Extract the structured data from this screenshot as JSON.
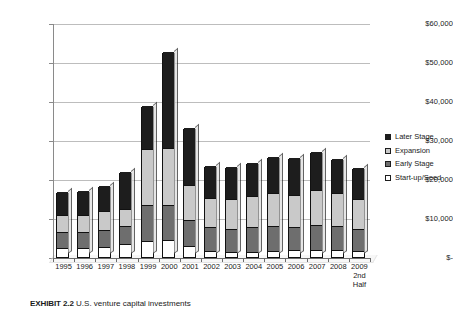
{
  "chart_data": {
    "type": "bar",
    "subtype": "stacked-column-3d",
    "title": "",
    "xlabel": "",
    "ylabel": "",
    "ylim": [
      0,
      60000
    ],
    "yticks": [
      "$-",
      "$10,000",
      "$20,000",
      "$30,000",
      "$40,000",
      "$50,000",
      "$60,000"
    ],
    "ytick_values": [
      0,
      10000,
      20000,
      30000,
      40000,
      50000,
      60000
    ],
    "grid": true,
    "legend_position": "right",
    "categories": [
      "1995",
      "1996",
      "1997",
      "1998",
      "1999",
      "2000",
      "2001",
      "2002",
      "2003",
      "2004",
      "2005",
      "2006",
      "2007",
      "2008",
      "2009"
    ],
    "category_sublabels": [
      "",
      "",
      "",
      "",
      "",
      "",
      "",
      "",
      "",
      "",
      "",
      "",
      "",
      "",
      "2nd Half"
    ],
    "series": [
      {
        "name": "Start-up/Seed",
        "color": "#ffffff",
        "values": [
          2200,
          2300,
          2500,
          3300,
          4100,
          4400,
          2700,
          1500,
          1300,
          1400,
          1600,
          1700,
          1900,
          1700,
          1500
        ]
      },
      {
        "name": "Early Stage",
        "color": "#6e6e6e",
        "values": [
          4200,
          4000,
          4300,
          4600,
          9300,
          9000,
          6700,
          6100,
          6000,
          6200,
          6400,
          6000,
          6400,
          6300,
          5600
        ]
      },
      {
        "name": "Expansion",
        "color": "#c9c9c9",
        "values": [
          4300,
          4400,
          4900,
          4400,
          14300,
          14500,
          9000,
          7600,
          7500,
          8100,
          8300,
          8200,
          8900,
          8400,
          7700
        ]
      },
      {
        "name": "Later Stage",
        "color": "#1d1d1d",
        "values": [
          6000,
          6200,
          6500,
          9500,
          11000,
          24600,
          14800,
          8200,
          8200,
          8400,
          9300,
          9500,
          9600,
          8800,
          8000
        ]
      }
    ],
    "totals": [
      16700,
      16900,
      18200,
      21800,
      38700,
      52500,
      33200,
      23400,
      23000,
      24100,
      25600,
      25400,
      26800,
      25200,
      22800
    ]
  },
  "legend": {
    "items": [
      {
        "label": "Later Stage",
        "swatch": "black-square-icon"
      },
      {
        "label": "Expansion",
        "swatch": "light-gray-square-icon"
      },
      {
        "label": "Early Stage",
        "swatch": "dark-gray-square-icon"
      },
      {
        "label": "Start-up/Seed",
        "swatch": "white-square-icon"
      }
    ]
  },
  "caption": {
    "exhibit_label": "EXHIBIT 2.2",
    "text": "U.S. venture capital investments"
  }
}
